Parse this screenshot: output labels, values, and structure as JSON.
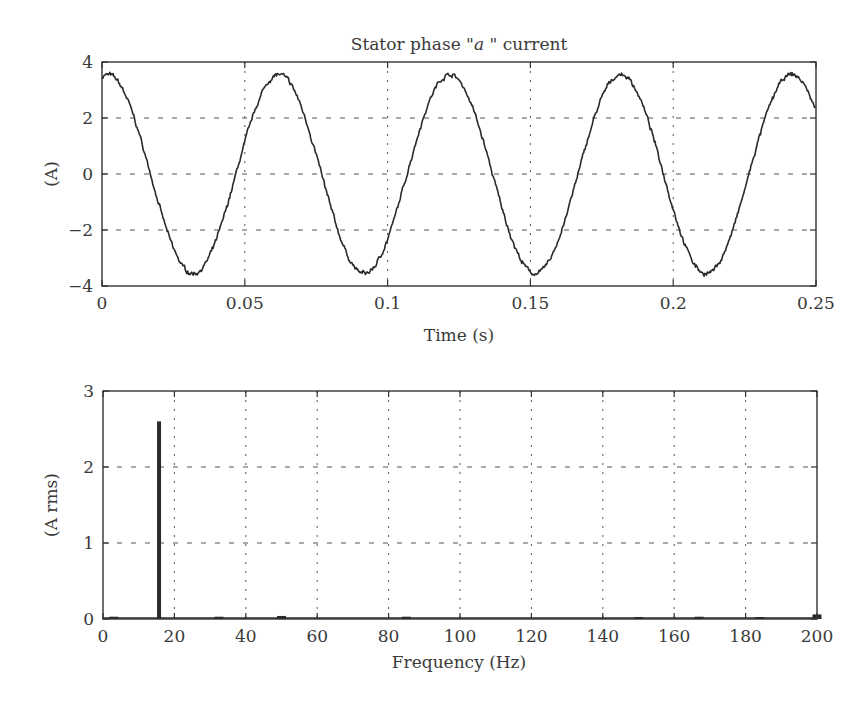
{
  "colors": {
    "background": "#ffffff",
    "line": "#2a2a2a",
    "axes": "#333333",
    "grid": "#555555",
    "text": "#3a3a3a"
  },
  "chart_data": [
    {
      "id": "time-plot",
      "type": "line",
      "title_prefix": "Stator phase \"",
      "title_italic": "a",
      "title_suffix": " \" current",
      "title": "Stator phase \"a\" current",
      "xlabel": "Time (s)",
      "ylabel": "(A)",
      "xlim": [
        0,
        0.25
      ],
      "ylim": [
        -4,
        4
      ],
      "xticks": [
        0,
        0.05,
        0.1,
        0.15,
        0.2,
        0.25
      ],
      "xtick_labels": [
        "0",
        "0.05",
        "0.1",
        "0.15",
        "0.2",
        "0.25"
      ],
      "yticks": [
        -4,
        -2,
        0,
        2,
        4
      ],
      "ytick_labels": [
        "−4",
        "−2",
        "0",
        "2",
        "4"
      ],
      "grid": true,
      "signal": {
        "description": "Noisy sinusoid",
        "amplitude": 3.55,
        "frequency_hz": 16.7,
        "peak_time_s": 0.002,
        "noise_amplitude": 0.09,
        "end_value": 2.4
      },
      "peaks": [
        {
          "t": 0.003,
          "y": 3.5
        },
        {
          "t": 0.063,
          "y": 3.6
        },
        {
          "t": 0.122,
          "y": 3.6
        },
        {
          "t": 0.182,
          "y": 3.65
        },
        {
          "t": 0.242,
          "y": 3.6
        }
      ],
      "troughs": [
        {
          "t": 0.033,
          "y": -3.6
        },
        {
          "t": 0.093,
          "y": -3.65
        },
        {
          "t": 0.152,
          "y": -3.65
        },
        {
          "t": 0.212,
          "y": -3.6
        }
      ]
    },
    {
      "id": "spectrum-plot",
      "type": "bar",
      "title": "",
      "xlabel": "Frequency (Hz)",
      "ylabel": "(A rms)",
      "xlim": [
        0,
        200
      ],
      "ylim": [
        0,
        3
      ],
      "xticks": [
        0,
        20,
        40,
        60,
        80,
        100,
        120,
        140,
        160,
        180,
        200
      ],
      "xtick_labels": [
        "0",
        "20",
        "40",
        "60",
        "80",
        "100",
        "120",
        "140",
        "160",
        "180",
        "200"
      ],
      "yticks": [
        0,
        1,
        2,
        3
      ],
      "ytick_labels": [
        "0",
        "1",
        "2",
        "3"
      ],
      "grid": true,
      "x": [
        3,
        15.7,
        32.5,
        50,
        85,
        150,
        167,
        184,
        200
      ],
      "values": [
        0.03,
        2.6,
        0.03,
        0.04,
        0.03,
        0.01,
        0.03,
        0.02,
        0.06
      ]
    }
  ]
}
